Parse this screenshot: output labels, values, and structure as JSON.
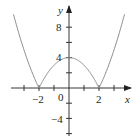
{
  "chart_data": {
    "type": "line",
    "title": "",
    "function": "y = |x^2 - 4|",
    "xlabel": "x",
    "ylabel": "y",
    "xlim": [
      -3.7,
      3.7
    ],
    "ylim": [
      -6.2,
      10.5
    ],
    "grid": false,
    "legend": null,
    "x_ticks": [
      -3,
      -2,
      -1,
      0,
      1,
      2,
      3
    ],
    "y_ticks": [
      -6,
      -4,
      -2,
      2,
      4,
      6,
      8
    ],
    "x_tick_labels": [
      {
        "value": -2,
        "text": "−2"
      },
      {
        "value": 2,
        "text": "2"
      }
    ],
    "y_tick_labels": [
      {
        "value": 8,
        "text": "8"
      },
      {
        "value": 4,
        "text": "4"
      },
      {
        "value": -4,
        "text": "−4"
      }
    ],
    "origin_label": "0",
    "series": [
      {
        "name": "|x^2 - 4|",
        "color": "#8c8c8c",
        "x": [
          -3.7,
          -3.5,
          -3,
          -2.5,
          -2,
          -1.5,
          -1,
          -0.5,
          0,
          0.5,
          1,
          1.5,
          2,
          2.5,
          3,
          3.5,
          3.7
        ],
        "values": [
          9.69,
          8.25,
          5,
          2.25,
          0,
          1.75,
          3,
          3.75,
          4,
          3.75,
          3,
          1.75,
          0,
          2.25,
          5,
          8.25,
          9.69
        ]
      }
    ],
    "key_points": [
      {
        "x": -2,
        "y": 0
      },
      {
        "x": 0,
        "y": 4
      },
      {
        "x": 2,
        "y": 0
      }
    ]
  },
  "colors": {
    "axis": "#231f20",
    "curve": "#8c8c8c",
    "background": "#ffffff"
  }
}
